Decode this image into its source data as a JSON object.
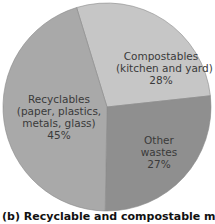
{
  "chart_data": {
    "type": "pie",
    "title": "",
    "caption": "(b) Recyclable and compostable materials",
    "slices": [
      {
        "name": "Compostables (kitchen and yard)",
        "value": 28,
        "label_lines": [
          "Compostables",
          "(kitchen and yard)",
          "28%"
        ],
        "color": "#c6c6c6"
      },
      {
        "name": "Other wastes",
        "value": 27,
        "label_lines": [
          "Other",
          "wastes",
          "27%"
        ],
        "color": "#8f8f8f"
      },
      {
        "name": "Recyclables (paper, plastics, metals, glass)",
        "value": 45,
        "label_lines": [
          "Recyclables",
          "(paper, plastics,",
          "metals, glass)",
          "45%"
        ],
        "color": "#a9a9a9"
      }
    ],
    "start_angle_deg": -17,
    "direction": "clockwise",
    "legend": "none",
    "units": "%"
  },
  "labels": {
    "compost": {
      "l1": "Compostables",
      "l2": "(kitchen and yard)",
      "l3": "28%"
    },
    "other": {
      "l1": "Other",
      "l2": "wastes",
      "l3": "27%"
    },
    "recycle": {
      "l1": "Recyclables",
      "l2": "(paper, plastics,",
      "l3": "metals, glass)",
      "l4": "45%"
    }
  },
  "caption": "(b) Recyclable and compostable materials"
}
